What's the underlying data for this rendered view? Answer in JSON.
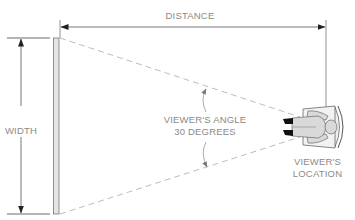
{
  "diagram": {
    "labels": {
      "distance": "DISTANCE",
      "width": "WIDTH",
      "viewer_angle_line1": "VIEWER'S ANGLE",
      "viewer_angle_line2": "30 DEGREES",
      "viewer_location_line1": "VIEWER'S",
      "viewer_location_line2": "LOCATION"
    },
    "elements": {
      "screen": "screen-bar",
      "viewer": "seated-viewer-top-view"
    },
    "colors": {
      "line": "#8a8a8a",
      "text": "#8a8a8a",
      "screen_fill": "#e4e4e4",
      "figure_fill": "#d9d9d9",
      "shoes": "#111111"
    }
  }
}
